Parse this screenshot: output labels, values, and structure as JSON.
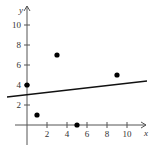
{
  "chart_data": {
    "type": "scatter",
    "title": "",
    "xlabel": "x",
    "ylabel": "y",
    "xlim": [
      -1.2,
      12
    ],
    "ylim": [
      -2,
      11.5
    ],
    "grid": false,
    "legend": null,
    "x_ticks": [
      2,
      4,
      6,
      8,
      10
    ],
    "y_ticks": [
      2,
      4,
      6,
      8,
      10
    ],
    "x_tick_labels": [
      "2",
      "4",
      "6",
      "8",
      "10"
    ],
    "y_tick_labels": [
      "2",
      "4",
      "6",
      "8",
      "10"
    ],
    "series": [
      {
        "name": "points",
        "type": "scatter",
        "points": [
          {
            "x": 0,
            "y": 4
          },
          {
            "x": 1,
            "y": 1
          },
          {
            "x": 3,
            "y": 7
          },
          {
            "x": 5,
            "y": 0
          },
          {
            "x": 9,
            "y": 5
          }
        ]
      },
      {
        "name": "regression line",
        "type": "line",
        "points": [
          {
            "x": -2,
            "y": 2.8
          },
          {
            "x": 12,
            "y": 4.4
          }
        ]
      }
    ],
    "colors": {
      "points": "#000000",
      "line": "#111111",
      "axes": "#555555"
    }
  }
}
